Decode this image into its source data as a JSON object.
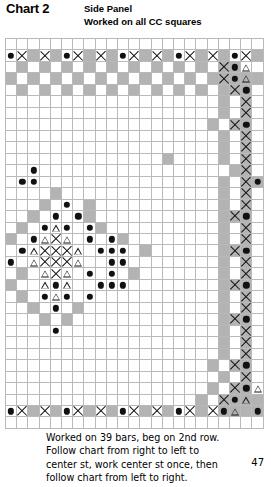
{
  "header": {
    "chart_title": "Chart 2",
    "subtitle_line1": "Side Panel",
    "subtitle_line2": "Worked on all CC squares"
  },
  "footer": {
    "center_bar_label": "center bar",
    "note": "Worked on 39 bars, beg on 2nd row. Follow chart from right to left to center st, work center st once, then follow chart from left to right.",
    "page_number": "47"
  },
  "legend": {
    "symbols": [
      {
        "key": "dot",
        "name": "filled-dot",
        "glyph": "●"
      },
      {
        "key": "x",
        "name": "cross",
        "glyph": "✕"
      },
      {
        "key": "tri",
        "name": "open-triangle",
        "glyph": "△"
      },
      {
        "key": "sh",
        "name": "shaded-cc-square",
        "glyph": ""
      },
      {
        "key": "",
        "name": "empty-square",
        "glyph": ""
      }
    ]
  },
  "colors": {
    "shaded_square": "#b3b3b3",
    "grid_line": "#b9b9b9",
    "heavy_line": "#2b2b2b",
    "symbol": "#111111",
    "background": "#ffffff"
  },
  "chart_data": {
    "type": "table",
    "columns": 23,
    "rows": 34,
    "cell_legend": {
      ".": "empty square",
      "s": "shaded CC square",
      "o": "filled dot on white",
      "O": "filled dot on shaded square",
      "x": "cross on white",
      "X": "cross on shaded square",
      "t": "open triangle on white",
      "T": "open triangle on shaded square"
    },
    "grid": [
      ".......................",
      "oxsxsoxsxsoxsxsoxsxsoxs",
      ".s.s.s.s.s.s.s.s.s.XOt.",
      "s.s.s.s.s.s.s.s.s.sXOTs",
      ".s.s.s.s.s.s.s.s.s.sXO.",
      "...................s.X.",
      "...................s.X.",
      "..................s.XO.",
      "...................s.X.",
      "...................s.X.",
      "..............s....s.X.",
      "..o.................sX.",
      ".oo................s.XO.",
      "....s..............s.X.",
      "...s.o.s...........s.X.",
      "..s.o.os...........sXO.",
      ".s.oto.os..........s.X.",
      "s.otxt.o.os........s.X.",
      ".otxxxt.ooo.s......sXO.",
      "o.txxxt..oo........s.X.",
      ".s.txt.o.o.s.......s.X.",
      "s..tot..ooo........sXO.",
      ".s.oto.o...........s.X.",
      "..s.o.s............s.X.",
      "...s.s.............sXO.",
      "....o..............s.X.",
      "...................s.X.",
      "...................s.X.",
      "..................s.XO.",
      "...................s.X.",
      "..................s.XOt",
      ".................s.XOTs",
      "oxsxsoxsxsoxsxsoxsxOTsO",
      "......................."
    ],
    "notes": [
      "Shaded squares indicate CC (contrast colour) squares.",
      "Central motif is an eight-point star/snowflake of dots and open triangles with a crossed core.",
      "Top and bottom border rows repeat a dot/cross motif across shaded squares.",
      "Right-hand columns carry a vertical border of crosses, dots and shaded squares."
    ]
  }
}
